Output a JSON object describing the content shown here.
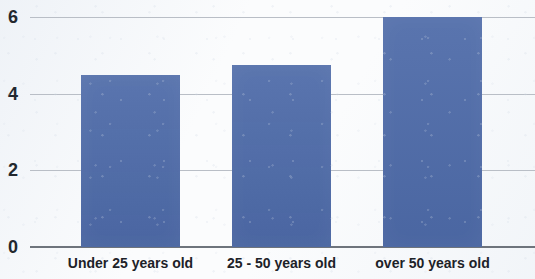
{
  "chart_data": {
    "type": "bar",
    "title": "",
    "subtitle": "",
    "xlabel": "",
    "ylabel": "",
    "categories": [
      "Under 25 years old",
      "25 - 50 years old",
      "over 50 years old"
    ],
    "values": [
      4.5,
      4.75,
      6.0
    ],
    "ylim": [
      0,
      6.4
    ],
    "ytick_labels": [
      "0",
      "2",
      "4",
      "6"
    ],
    "ytick_values": [
      0,
      2,
      4,
      6
    ],
    "grid": true,
    "legend": false,
    "legend_position": "none",
    "series": [
      {
        "name": "",
        "values": [
          4.5,
          4.75,
          6.0
        ]
      }
    ],
    "colors": {
      "bar": "#4d6aa8",
      "gridline": "#b9bec6",
      "axis": "#6e747c",
      "text": "#1d2228",
      "background": "#fbfcfd"
    }
  },
  "axis": {
    "y": {
      "ticks": [
        {
          "label": "6",
          "value": 6
        },
        {
          "label": "4",
          "value": 4
        },
        {
          "label": "2",
          "value": 2
        },
        {
          "label": "0",
          "value": 0
        }
      ]
    },
    "x": {
      "ticks": [
        {
          "label": "Under 25 years old"
        },
        {
          "label": "25 - 50 years old"
        },
        {
          "label": "over 50 years old"
        }
      ]
    }
  }
}
